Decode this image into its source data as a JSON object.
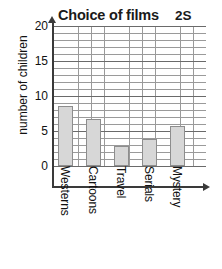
{
  "header": {
    "title": "Choice of films",
    "code": "2S"
  },
  "axes": {
    "ylabel": "number of children",
    "yticks": [
      "0",
      "5",
      "10",
      "15",
      "20"
    ],
    "ymin": 0,
    "ymax": 21
  },
  "chart_data": {
    "type": "bar",
    "title": "Choice of films",
    "subtitle": "2S",
    "xlabel": "",
    "ylabel": "number of children",
    "categories": [
      "Westerns",
      "Cartoons",
      "Travel",
      "Serials",
      "Mystery"
    ],
    "values": [
      9,
      7,
      3,
      4,
      6
    ],
    "ylim": [
      0,
      21
    ],
    "yticks": [
      0,
      5,
      10,
      15,
      20
    ],
    "grid": true,
    "legend": "none",
    "bar_fill": "#d7d7d7",
    "bar_border": "#8d8d8d"
  }
}
